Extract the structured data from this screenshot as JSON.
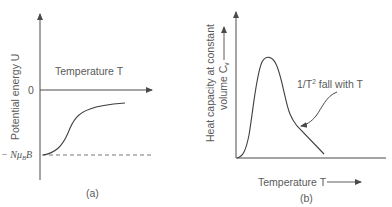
{
  "panel_a": {
    "caption": "(a)",
    "y_axis_label": "Potential energy U",
    "x_axis_label": "Temperature T",
    "zero_tick_label": "0",
    "asymptote_label_prefix": "− Nμ",
    "asymptote_label_sub": "B",
    "asymptote_label_suffix": "B",
    "curve_description": "Sigmoid rise from −Nμ_B B at T=0 approaching 0 as T increases"
  },
  "panel_b": {
    "caption": "(b)",
    "y_axis_label_line1": "Heat capacity at constant",
    "y_axis_label_line2": "volume C",
    "y_axis_label_sub": "v",
    "x_axis_label": "Temperature T",
    "annotation_prefix": "1/T",
    "annotation_sup": "2",
    "annotation_suffix": " fall with T",
    "curve_description": "Schottky anomaly: peak at low T, then 1/T² falloff"
  },
  "colors": {
    "line": "#4a4a4a",
    "text": "#5a5a5a",
    "background": "#ffffff"
  }
}
